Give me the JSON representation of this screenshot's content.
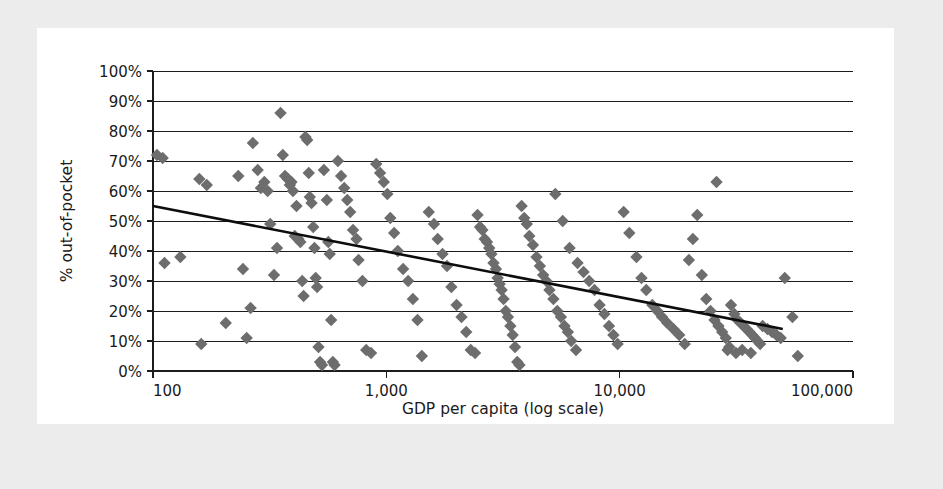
{
  "chart_data": {
    "type": "scatter",
    "title": "",
    "xlabel": "GDP per capita (log scale)",
    "ylabel": "% out-of-pocket",
    "xscale": "log",
    "xlim": [
      100,
      100000
    ],
    "ylim": [
      0,
      1.0
    ],
    "grid": true,
    "legend": null,
    "xtick_labels": [
      "100",
      "1,000",
      "10,000",
      "100,000"
    ],
    "xtick_values": [
      100,
      1000,
      10000,
      100000
    ],
    "ytick_labels": [
      "0%",
      "10%",
      "20%",
      "30%",
      "40%",
      "50%",
      "60%",
      "70%",
      "80%",
      "90%",
      "100%"
    ],
    "ytick_values": [
      0,
      10,
      20,
      30,
      40,
      50,
      60,
      70,
      80,
      90,
      100
    ],
    "marker_shape": "diamond",
    "marker_color": "#6d6d6d",
    "trendline": {
      "color": "#0d0d0d",
      "x_start": 100,
      "y_start": 55,
      "x_end": 50000,
      "y_end": 14,
      "kind": "linear-fit-on-log-x"
    },
    "points": [
      [
        104,
        72
      ],
      [
        110,
        71
      ],
      [
        112,
        36
      ],
      [
        131,
        38
      ],
      [
        158,
        64
      ],
      [
        161,
        9
      ],
      [
        170,
        62
      ],
      [
        205,
        16
      ],
      [
        232,
        65
      ],
      [
        243,
        34
      ],
      [
        252,
        11
      ],
      [
        262,
        21
      ],
      [
        268,
        76
      ],
      [
        281,
        67
      ],
      [
        290,
        61
      ],
      [
        300,
        63
      ],
      [
        310,
        60
      ],
      [
        318,
        49
      ],
      [
        330,
        32
      ],
      [
        340,
        41
      ],
      [
        352,
        86
      ],
      [
        360,
        72
      ],
      [
        368,
        65
      ],
      [
        378,
        64
      ],
      [
        386,
        62
      ],
      [
        392,
        63
      ],
      [
        398,
        60
      ],
      [
        405,
        45
      ],
      [
        412,
        55
      ],
      [
        420,
        44
      ],
      [
        428,
        43
      ],
      [
        436,
        30
      ],
      [
        442,
        25
      ],
      [
        450,
        78
      ],
      [
        458,
        77
      ],
      [
        465,
        66
      ],
      [
        470,
        58
      ],
      [
        478,
        56
      ],
      [
        486,
        48
      ],
      [
        492,
        41
      ],
      [
        498,
        31
      ],
      [
        505,
        28
      ],
      [
        512,
        8
      ],
      [
        520,
        3
      ],
      [
        530,
        2
      ],
      [
        540,
        67
      ],
      [
        556,
        57
      ],
      [
        564,
        43
      ],
      [
        572,
        39
      ],
      [
        580,
        17
      ],
      [
        590,
        3
      ],
      [
        600,
        2
      ],
      [
        620,
        70
      ],
      [
        640,
        65
      ],
      [
        660,
        61
      ],
      [
        680,
        57
      ],
      [
        700,
        53
      ],
      [
        720,
        47
      ],
      [
        745,
        44
      ],
      [
        760,
        37
      ],
      [
        790,
        30
      ],
      [
        820,
        7
      ],
      [
        860,
        6
      ],
      [
        905,
        69
      ],
      [
        940,
        66
      ],
      [
        975,
        63
      ],
      [
        1010,
        59
      ],
      [
        1040,
        51
      ],
      [
        1080,
        46
      ],
      [
        1120,
        40
      ],
      [
        1180,
        34
      ],
      [
        1240,
        30
      ],
      [
        1300,
        24
      ],
      [
        1360,
        17
      ],
      [
        1420,
        5
      ],
      [
        1520,
        53
      ],
      [
        1600,
        49
      ],
      [
        1660,
        44
      ],
      [
        1740,
        39
      ],
      [
        1820,
        35
      ],
      [
        1900,
        28
      ],
      [
        2000,
        22
      ],
      [
        2100,
        18
      ],
      [
        2200,
        13
      ],
      [
        2300,
        7
      ],
      [
        2400,
        6
      ],
      [
        2460,
        52
      ],
      [
        2520,
        48
      ],
      [
        2580,
        47
      ],
      [
        2640,
        44
      ],
      [
        2700,
        43
      ],
      [
        2760,
        41
      ],
      [
        2820,
        39
      ],
      [
        2880,
        36
      ],
      [
        2950,
        34
      ],
      [
        3000,
        31
      ],
      [
        3060,
        29
      ],
      [
        3120,
        27
      ],
      [
        3180,
        24
      ],
      [
        3250,
        20
      ],
      [
        3320,
        18
      ],
      [
        3400,
        15
      ],
      [
        3480,
        12
      ],
      [
        3560,
        8
      ],
      [
        3640,
        3
      ],
      [
        3720,
        2
      ],
      [
        3800,
        55
      ],
      [
        3900,
        51
      ],
      [
        4000,
        49
      ],
      [
        4100,
        45
      ],
      [
        4250,
        42
      ],
      [
        4400,
        38
      ],
      [
        4550,
        35
      ],
      [
        4700,
        32
      ],
      [
        4850,
        30
      ],
      [
        5000,
        27
      ],
      [
        5200,
        24
      ],
      [
        5400,
        20
      ],
      [
        5600,
        18
      ],
      [
        5800,
        15
      ],
      [
        6000,
        13
      ],
      [
        6200,
        10
      ],
      [
        6500,
        7
      ],
      [
        5300,
        59
      ],
      [
        5700,
        50
      ],
      [
        6100,
        41
      ],
      [
        6600,
        36
      ],
      [
        7000,
        33
      ],
      [
        7400,
        30
      ],
      [
        7800,
        27
      ],
      [
        8200,
        22
      ],
      [
        8600,
        19
      ],
      [
        9000,
        15
      ],
      [
        9400,
        12
      ],
      [
        9800,
        9
      ],
      [
        10400,
        53
      ],
      [
        11000,
        46
      ],
      [
        11800,
        38
      ],
      [
        12400,
        31
      ],
      [
        13000,
        27
      ],
      [
        13800,
        22
      ],
      [
        14500,
        20
      ],
      [
        15200,
        18
      ],
      [
        16000,
        16
      ],
      [
        17000,
        14
      ],
      [
        18000,
        12
      ],
      [
        19000,
        9
      ],
      [
        19800,
        37
      ],
      [
        20600,
        44
      ],
      [
        21500,
        52
      ],
      [
        22500,
        32
      ],
      [
        23500,
        24
      ],
      [
        24500,
        20
      ],
      [
        25500,
        17
      ],
      [
        26500,
        15
      ],
      [
        27500,
        13
      ],
      [
        28500,
        11
      ],
      [
        29500,
        8
      ],
      [
        26000,
        63
      ],
      [
        30000,
        22
      ],
      [
        31000,
        19
      ],
      [
        32000,
        17
      ],
      [
        33000,
        16
      ],
      [
        34000,
        15
      ],
      [
        35000,
        14
      ],
      [
        36000,
        13
      ],
      [
        37000,
        12
      ],
      [
        38000,
        11
      ],
      [
        39000,
        10
      ],
      [
        40000,
        9
      ],
      [
        41000,
        15
      ],
      [
        43000,
        14
      ],
      [
        45000,
        13
      ],
      [
        47000,
        12
      ],
      [
        49000,
        11
      ],
      [
        51000,
        31
      ],
      [
        55000,
        18
      ],
      [
        58000,
        5
      ],
      [
        29000,
        7
      ],
      [
        31500,
        6
      ],
      [
        33500,
        7
      ],
      [
        36500,
        6
      ]
    ]
  },
  "accessibility": {
    "figure_role": "scatter plot with linear trend line"
  }
}
